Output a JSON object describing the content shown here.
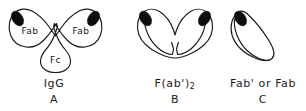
{
  "figure": {
    "background_color": "#ffffff",
    "line_color": "#1a1a1a",
    "tip_color": "#0d0d0d",
    "panels": [
      {
        "id": "igg",
        "name": "IgG",
        "letter": "A",
        "region_labels": [
          "Fab",
          "Fab",
          "Fc"
        ],
        "shape": "y-shaped-antibody",
        "tips": 2
      },
      {
        "id": "fab2",
        "name": "F(ab')",
        "name_subscript": "2",
        "letter": "B",
        "region_labels": [],
        "shape": "v-shaped-fragment",
        "tips": 2
      },
      {
        "id": "fab",
        "name": "Fab' or Fab",
        "letter": "C",
        "region_labels": [],
        "shape": "single-arm-fragment",
        "tips": 1
      }
    ]
  }
}
